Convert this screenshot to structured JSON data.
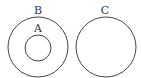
{
  "diagram": {
    "type": "set-diagram",
    "sets": [
      {
        "label": "B",
        "contains": [
          "A"
        ]
      },
      {
        "label": "A",
        "subset_of": "B"
      },
      {
        "label": "C",
        "disjoint_from": [
          "A",
          "B"
        ]
      }
    ],
    "labels": {
      "b": "B",
      "a": "A",
      "c": "C"
    },
    "stroke_color": "#444444"
  }
}
